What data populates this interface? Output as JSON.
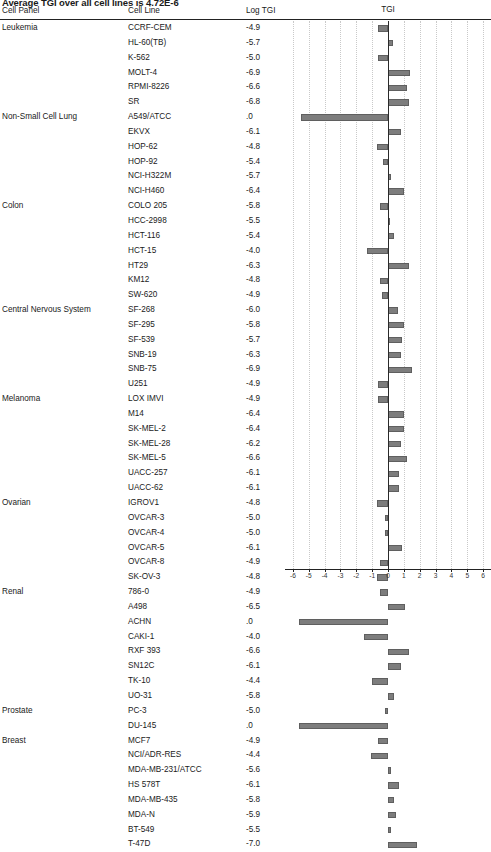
{
  "title": "Average TGI over all cell lines is 4.72E-6",
  "columns": {
    "panel": "Cell Panel",
    "cell_line": "Cell Line",
    "log_tgi": "Log TGI",
    "chart": "TGI"
  },
  "chart_data": {
    "type": "bar",
    "orientation": "horizontal",
    "title": "TGI",
    "xlabel": "",
    "ylabel": "",
    "xlim": [
      -6.5,
      6.5
    ],
    "grid": true,
    "zero_line": 0,
    "ticks": [
      -6,
      -5,
      -4,
      -3,
      -2,
      -1,
      0,
      1,
      2,
      3,
      4,
      5,
      6
    ],
    "tick_labels": [
      "-6",
      "-5",
      "-4",
      "-3",
      "-2",
      "-1",
      "0",
      "1",
      "2",
      "3",
      "4",
      "5",
      "6"
    ],
    "categories": [
      "CCRF-CEM",
      "HL-60(TB)",
      "K-562",
      "MOLT-4",
      "RPMI-8226",
      "SR",
      "A549/ATCC",
      "EKVX",
      "HOP-62",
      "HOP-92",
      "NCI-H322M",
      "NCI-H460",
      "COLO 205",
      "HCC-2998",
      "HCT-116",
      "HCT-15",
      "HT29",
      "KM12",
      "SW-620",
      "SF-268",
      "SF-295",
      "SF-539",
      "SNB-19",
      "SNB-75",
      "U251",
      "LOX IMVI",
      "M14",
      "SK-MEL-2",
      "SK-MEL-28",
      "SK-MEL-5",
      "UACC-257",
      "UACC-62",
      "IGROV1",
      "OVCAR-3",
      "OVCAR-4",
      "OVCAR-5",
      "OVCAR-8",
      "SK-OV-3",
      "786-0",
      "A498",
      "ACHN",
      "CAKI-1",
      "RXF 393",
      "SN12C",
      "TK-10",
      "UO-31",
      "PC-3",
      "DU-145",
      "MCF7",
      "NCI/ADR-RES",
      "MDA-MB-231/ATCC",
      "HS 578T",
      "MDA-MB-435",
      "MDA-N",
      "BT-549",
      "T-47D"
    ],
    "values": [
      -0.6,
      0.3,
      -0.6,
      1.4,
      1.2,
      1.3,
      -5.5,
      0.8,
      -0.7,
      -0.3,
      0.2,
      1.0,
      -0.5,
      0.1,
      0.4,
      -1.3,
      1.3,
      -0.5,
      -0.4,
      0.6,
      1.0,
      0.9,
      0.8,
      1.5,
      -0.6,
      -0.6,
      1.0,
      1.0,
      0.8,
      1.2,
      0.7,
      0.7,
      -0.7,
      -0.2,
      -0.2,
      0.9,
      -0.5,
      -0.7,
      -0.5,
      1.1,
      -5.6,
      -1.5,
      1.3,
      0.8,
      -1.0,
      0.4,
      -0.2,
      -5.6,
      -0.6,
      -1.1,
      0.2,
      0.7,
      0.4,
      0.5,
      0.2,
      1.8
    ]
  },
  "table": {
    "rows": [
      {
        "panel": "Leukemia",
        "cell_line": "CCRF-CEM",
        "log_tgi": "-4.9"
      },
      {
        "panel": "",
        "cell_line": "HL-60(TB)",
        "log_tgi": "-5.7"
      },
      {
        "panel": "",
        "cell_line": "K-562",
        "log_tgi": "-5.0"
      },
      {
        "panel": "",
        "cell_line": "MOLT-4",
        "log_tgi": "-6.9"
      },
      {
        "panel": "",
        "cell_line": "RPMI-8226",
        "log_tgi": "-6.6"
      },
      {
        "panel": "",
        "cell_line": "SR",
        "log_tgi": "-6.8"
      },
      {
        "panel": "Non-Small Cell Lung",
        "cell_line": "A549/ATCC",
        "log_tgi": ".0"
      },
      {
        "panel": "",
        "cell_line": "EKVX",
        "log_tgi": "-6.1"
      },
      {
        "panel": "",
        "cell_line": "HOP-62",
        "log_tgi": "-4.8"
      },
      {
        "panel": "",
        "cell_line": "HOP-92",
        "log_tgi": "-5.4"
      },
      {
        "panel": "",
        "cell_line": "NCI-H322M",
        "log_tgi": "-5.7"
      },
      {
        "panel": "",
        "cell_line": "NCI-H460",
        "log_tgi": "-6.4"
      },
      {
        "panel": "Colon",
        "cell_line": "COLO 205",
        "log_tgi": "-5.8"
      },
      {
        "panel": "",
        "cell_line": "HCC-2998",
        "log_tgi": "-5.5"
      },
      {
        "panel": "",
        "cell_line": "HCT-116",
        "log_tgi": "-5.4"
      },
      {
        "panel": "",
        "cell_line": "HCT-15",
        "log_tgi": "-4.0"
      },
      {
        "panel": "",
        "cell_line": "HT29",
        "log_tgi": "-6.3"
      },
      {
        "panel": "",
        "cell_line": "KM12",
        "log_tgi": "-4.8"
      },
      {
        "panel": "",
        "cell_line": "SW-620",
        "log_tgi": "-4.9"
      },
      {
        "panel": "Central Nervous System",
        "cell_line": "SF-268",
        "log_tgi": "-6.0"
      },
      {
        "panel": "",
        "cell_line": "SF-295",
        "log_tgi": "-5.8"
      },
      {
        "panel": "",
        "cell_line": "SF-539",
        "log_tgi": "-5.7"
      },
      {
        "panel": "",
        "cell_line": "SNB-19",
        "log_tgi": "-6.3"
      },
      {
        "panel": "",
        "cell_line": "SNB-75",
        "log_tgi": "-6.9"
      },
      {
        "panel": "",
        "cell_line": "U251",
        "log_tgi": "-4.9"
      },
      {
        "panel": "Melanoma",
        "cell_line": "LOX IMVI",
        "log_tgi": "-4.9"
      },
      {
        "panel": "",
        "cell_line": "M14",
        "log_tgi": "-6.4"
      },
      {
        "panel": "",
        "cell_line": "SK-MEL-2",
        "log_tgi": "-6.4"
      },
      {
        "panel": "",
        "cell_line": "SK-MEL-28",
        "log_tgi": "-6.2"
      },
      {
        "panel": "",
        "cell_line": "SK-MEL-5",
        "log_tgi": "-6.6"
      },
      {
        "panel": "",
        "cell_line": "UACC-257",
        "log_tgi": "-6.1"
      },
      {
        "panel": "",
        "cell_line": "UACC-62",
        "log_tgi": "-6.1"
      },
      {
        "panel": "Ovarian",
        "cell_line": "IGROV1",
        "log_tgi": "-4.8"
      },
      {
        "panel": "",
        "cell_line": "OVCAR-3",
        "log_tgi": "-5.0"
      },
      {
        "panel": "",
        "cell_line": "OVCAR-4",
        "log_tgi": "-5.0"
      },
      {
        "panel": "",
        "cell_line": "OVCAR-5",
        "log_tgi": "-6.1"
      },
      {
        "panel": "",
        "cell_line": "OVCAR-8",
        "log_tgi": "-4.9"
      },
      {
        "panel": "",
        "cell_line": "SK-OV-3",
        "log_tgi": "-4.8"
      },
      {
        "panel": "Renal",
        "cell_line": "786-0",
        "log_tgi": "-4.9"
      },
      {
        "panel": "",
        "cell_line": "A498",
        "log_tgi": "-6.5"
      },
      {
        "panel": "",
        "cell_line": "ACHN",
        "log_tgi": ".0"
      },
      {
        "panel": "",
        "cell_line": "CAKI-1",
        "log_tgi": "-4.0"
      },
      {
        "panel": "",
        "cell_line": "RXF 393",
        "log_tgi": "-6.6"
      },
      {
        "panel": "",
        "cell_line": "SN12C",
        "log_tgi": "-6.1"
      },
      {
        "panel": "",
        "cell_line": "TK-10",
        "log_tgi": "-4.4"
      },
      {
        "panel": "",
        "cell_line": "UO-31",
        "log_tgi": "-5.8"
      },
      {
        "panel": "Prostate",
        "cell_line": "PC-3",
        "log_tgi": "-5.0"
      },
      {
        "panel": "",
        "cell_line": "DU-145",
        "log_tgi": ".0"
      },
      {
        "panel": "Breast",
        "cell_line": "MCF7",
        "log_tgi": "-4.9"
      },
      {
        "panel": "",
        "cell_line": "NCI/ADR-RES",
        "log_tgi": "-4.4"
      },
      {
        "panel": "",
        "cell_line": "MDA-MB-231/ATCC",
        "log_tgi": "-5.6"
      },
      {
        "panel": "",
        "cell_line": "HS 578T",
        "log_tgi": "-6.1"
      },
      {
        "panel": "",
        "cell_line": "MDA-MB-435",
        "log_tgi": "-5.8"
      },
      {
        "panel": "",
        "cell_line": "MDA-N",
        "log_tgi": "-5.9"
      },
      {
        "panel": "",
        "cell_line": "BT-549",
        "log_tgi": "-5.5"
      },
      {
        "panel": "",
        "cell_line": "T-47D",
        "log_tgi": "-7.0"
      }
    ]
  },
  "colors": {
    "bar": "#7d7d7d",
    "bar_border": "#5f5f5f",
    "axis": "#222222",
    "grid": "#c9c9c9",
    "text": "#1a1a1a"
  }
}
